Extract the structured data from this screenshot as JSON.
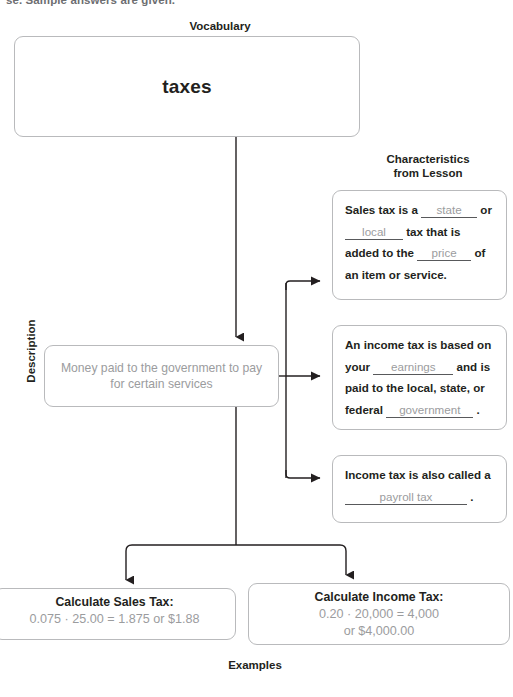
{
  "page": {
    "cut_header_text": "se. Sample answers are given.",
    "cut_footer_text": ""
  },
  "labels": {
    "vocabulary": "Vocabulary",
    "characteristics": "Characteristics\nfrom Lesson",
    "characteristics_line1": "Characteristics",
    "characteristics_line2": "from Lesson",
    "description": "Description",
    "examples": "Examples"
  },
  "vocabulary": {
    "term": "taxes"
  },
  "description": {
    "text": "Money paid to the government to pay for certain services"
  },
  "characteristics": [
    {
      "id": "sales-tax",
      "segments": [
        {
          "type": "text",
          "value": "Sales tax is a "
        },
        {
          "type": "blank",
          "value": "state"
        },
        {
          "type": "text",
          "value": " or "
        },
        {
          "type": "blank",
          "value": "local"
        },
        {
          "type": "text",
          "value": " tax that is added to the "
        },
        {
          "type": "blank",
          "value": "price"
        },
        {
          "type": "text",
          "value": " of an item or service."
        }
      ],
      "answers": [
        "state",
        "local",
        "price"
      ]
    },
    {
      "id": "income-tax-basis",
      "segments": [
        {
          "type": "text",
          "value": "An income tax is based on your "
        },
        {
          "type": "blank",
          "value": "earnings"
        },
        {
          "type": "text",
          "value": " and is paid to the local, state, or federal "
        },
        {
          "type": "blank",
          "value": "government"
        },
        {
          "type": "text",
          "value": "."
        }
      ],
      "answers": [
        "earnings",
        "government"
      ]
    },
    {
      "id": "income-tax-alias",
      "segments": [
        {
          "type": "text",
          "value": "Income tax is also called a "
        },
        {
          "type": "blank",
          "value": "payroll tax"
        },
        {
          "type": "text",
          "value": "."
        }
      ],
      "answers": [
        "payroll tax"
      ]
    }
  ],
  "characteristic_text": {
    "c1_p1": "Sales tax is a",
    "c1_blank1": "state",
    "c1_p2": "or",
    "c1_blank2": "local",
    "c1_p3": "tax that is",
    "c1_p4": "added to the",
    "c1_blank3": "price",
    "c1_p5": "of an item or service.",
    "c2_p1": "An income tax is based",
    "c2_p2": "on your",
    "c2_blank1": "earnings",
    "c2_p3": "and",
    "c2_p4": "is paid to the local, state,",
    "c2_p5": "or federal",
    "c2_blank2": "government",
    "c2_p6": ".",
    "c3_p1": "Income tax is also called",
    "c3_p2": "a",
    "c3_blank1": "payroll tax",
    "c3_p3": "."
  },
  "examples": [
    {
      "id": "sales-tax-example",
      "title": "Calculate Sales Tax:",
      "lines": [
        "0.075 · 25.00 = 1.875 or $1.88"
      ]
    },
    {
      "id": "income-tax-example",
      "title": "Calculate Income Tax:",
      "lines": [
        "0.20 · 20,000 = 4,000",
        "or $4,000.00"
      ]
    }
  ],
  "example_text": {
    "e1_title": "Calculate Sales Tax:",
    "e1_line1": "0.075 · 25.00 = 1.875 or $1.88",
    "e2_title": "Calculate Income Tax:",
    "e2_line1": "0.20 · 20,000 = 4,000",
    "e2_line2": "or $4,000.00"
  },
  "colors": {
    "box_border": "#b9babc",
    "text_dark": "#231f20",
    "answer_gray": "#9b9c9e",
    "connector": "#231f20",
    "blank_line": "#58595b",
    "background": "#ffffff"
  }
}
